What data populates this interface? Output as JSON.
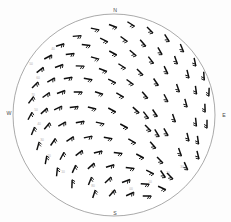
{
  "cardinals": [
    {
      "label": "N",
      "x": 115,
      "y": 11
    },
    {
      "label": "E",
      "x": 224,
      "y": 116
    },
    {
      "label": "S",
      "x": 115,
      "y": 214
    },
    {
      "label": "W",
      "x": 9,
      "y": 114
    }
  ],
  "limb": {
    "cx": 114,
    "cy": 115,
    "r": 101,
    "stroke": "#8e8e8e"
  },
  "pole": {
    "cx": 174,
    "cy": 147,
    "rays": 18,
    "ray_len": 9
  },
  "grid_labels": [
    {
      "text": "60",
      "x": 38,
      "y": 78
    },
    {
      "text": "70",
      "x": 33,
      "y": 95
    },
    {
      "text": "50",
      "x": 36,
      "y": 110
    },
    {
      "text": "40",
      "x": 39,
      "y": 124
    },
    {
      "text": "30",
      "x": 42,
      "y": 140
    },
    {
      "text": "20",
      "x": 49,
      "y": 156
    },
    {
      "text": "10",
      "x": 63,
      "y": 172
    },
    {
      "text": "80",
      "x": 93,
      "y": 186
    },
    {
      "text": "90",
      "x": 113,
      "y": 192
    },
    {
      "text": "00",
      "x": 131,
      "y": 189
    },
    {
      "text": "10",
      "x": 150,
      "y": 182
    },
    {
      "text": "20",
      "x": 168,
      "y": 173
    },
    {
      "text": "30",
      "x": 182,
      "y": 167
    },
    {
      "text": "50",
      "x": 31,
      "y": 64
    },
    {
      "text": "40",
      "x": 53,
      "y": 49
    }
  ],
  "chart_data": {
    "type": "scatter",
    "xlabel": "",
    "ylabel": "",
    "projection": "polar-stereographic",
    "legend": "none",
    "grid": true,
    "barbs": [
      {
        "x": 113,
        "y": 26,
        "a": 200,
        "n": 2
      },
      {
        "x": 131,
        "y": 24,
        "a": 212,
        "n": 2
      },
      {
        "x": 95,
        "y": 29,
        "a": 192,
        "n": 2
      },
      {
        "x": 150,
        "y": 30,
        "a": 225,
        "n": 2
      },
      {
        "x": 77,
        "y": 36,
        "a": 175,
        "n": 2
      },
      {
        "x": 167,
        "y": 38,
        "a": 237,
        "n": 2
      },
      {
        "x": 60,
        "y": 45,
        "a": 163,
        "n": 2
      },
      {
        "x": 182,
        "y": 48,
        "a": 247,
        "n": 2
      },
      {
        "x": 104,
        "y": 40,
        "a": 205,
        "n": 2
      },
      {
        "x": 124,
        "y": 39,
        "a": 216,
        "n": 2
      },
      {
        "x": 143,
        "y": 43,
        "a": 228,
        "n": 2
      },
      {
        "x": 86,
        "y": 45,
        "a": 188,
        "n": 2
      },
      {
        "x": 160,
        "y": 51,
        "a": 240,
        "n": 2
      },
      {
        "x": 48,
        "y": 57,
        "a": 152,
        "n": 2
      },
      {
        "x": 195,
        "y": 62,
        "a": 258,
        "n": 2
      },
      {
        "x": 70,
        "y": 54,
        "a": 172,
        "n": 2
      },
      {
        "x": 113,
        "y": 53,
        "a": 208,
        "n": 2
      },
      {
        "x": 133,
        "y": 53,
        "a": 220,
        "n": 2
      },
      {
        "x": 176,
        "y": 60,
        "a": 250,
        "n": 2
      },
      {
        "x": 95,
        "y": 58,
        "a": 196,
        "n": 2
      },
      {
        "x": 40,
        "y": 70,
        "a": 142,
        "n": 2
      },
      {
        "x": 59,
        "y": 66,
        "a": 160,
        "n": 2
      },
      {
        "x": 204,
        "y": 76,
        "a": 266,
        "n": 2
      },
      {
        "x": 151,
        "y": 60,
        "a": 232,
        "n": 2
      },
      {
        "x": 80,
        "y": 66,
        "a": 182,
        "n": 2
      },
      {
        "x": 122,
        "y": 66,
        "a": 212,
        "n": 2
      },
      {
        "x": 103,
        "y": 70,
        "a": 200,
        "n": 2
      },
      {
        "x": 166,
        "y": 70,
        "a": 244,
        "n": 2
      },
      {
        "x": 188,
        "y": 74,
        "a": 256,
        "n": 2
      },
      {
        "x": 35,
        "y": 85,
        "a": 134,
        "n": 2
      },
      {
        "x": 51,
        "y": 80,
        "a": 150,
        "n": 2
      },
      {
        "x": 68,
        "y": 78,
        "a": 170,
        "n": 2
      },
      {
        "x": 140,
        "y": 72,
        "a": 224,
        "n": 2
      },
      {
        "x": 88,
        "y": 79,
        "a": 190,
        "n": 2
      },
      {
        "x": 209,
        "y": 92,
        "a": 272,
        "n": 2
      },
      {
        "x": 112,
        "y": 81,
        "a": 206,
        "n": 2
      },
      {
        "x": 130,
        "y": 82,
        "a": 216,
        "n": 2
      },
      {
        "x": 156,
        "y": 82,
        "a": 236,
        "n": 2
      },
      {
        "x": 178,
        "y": 88,
        "a": 250,
        "n": 2
      },
      {
        "x": 196,
        "y": 90,
        "a": 262,
        "n": 2
      },
      {
        "x": 31,
        "y": 100,
        "a": 126,
        "n": 2
      },
      {
        "x": 46,
        "y": 95,
        "a": 144,
        "n": 2
      },
      {
        "x": 61,
        "y": 92,
        "a": 160,
        "n": 2
      },
      {
        "x": 78,
        "y": 92,
        "a": 180,
        "n": 2
      },
      {
        "x": 99,
        "y": 93,
        "a": 198,
        "n": 2
      },
      {
        "x": 120,
        "y": 95,
        "a": 210,
        "n": 2
      },
      {
        "x": 145,
        "y": 95,
        "a": 228,
        "n": 2
      },
      {
        "x": 166,
        "y": 98,
        "a": 242,
        "n": 2
      },
      {
        "x": 186,
        "y": 103,
        "a": 254,
        "n": 2
      },
      {
        "x": 205,
        "y": 108,
        "a": 268,
        "n": 2
      },
      {
        "x": 30,
        "y": 116,
        "a": 118,
        "n": 2
      },
      {
        "x": 44,
        "y": 111,
        "a": 138,
        "n": 2
      },
      {
        "x": 58,
        "y": 108,
        "a": 155,
        "n": 2
      },
      {
        "x": 74,
        "y": 107,
        "a": 174,
        "n": 2
      },
      {
        "x": 92,
        "y": 108,
        "a": 194,
        "n": 2
      },
      {
        "x": 112,
        "y": 110,
        "a": 208,
        "n": 2
      },
      {
        "x": 136,
        "y": 110,
        "a": 222,
        "n": 2
      },
      {
        "x": 155,
        "y": 113,
        "a": 236,
        "n": 2
      },
      {
        "x": 174,
        "y": 118,
        "a": 250,
        "n": 2
      },
      {
        "x": 196,
        "y": 122,
        "a": 264,
        "n": 2
      },
      {
        "x": 33,
        "y": 131,
        "a": 112,
        "n": 2
      },
      {
        "x": 47,
        "y": 126,
        "a": 130,
        "n": 2
      },
      {
        "x": 62,
        "y": 124,
        "a": 150,
        "n": 2
      },
      {
        "x": 80,
        "y": 122,
        "a": 170,
        "n": 2
      },
      {
        "x": 100,
        "y": 123,
        "a": 192,
        "n": 2
      },
      {
        "x": 124,
        "y": 126,
        "a": 208,
        "n": 2
      },
      {
        "x": 148,
        "y": 128,
        "a": 226,
        "n": 2
      },
      {
        "x": 166,
        "y": 132,
        "a": 240,
        "n": 2
      },
      {
        "x": 188,
        "y": 137,
        "a": 256,
        "n": 2
      },
      {
        "x": 38,
        "y": 146,
        "a": 106,
        "n": 2
      },
      {
        "x": 53,
        "y": 142,
        "a": 124,
        "n": 2
      },
      {
        "x": 70,
        "y": 139,
        "a": 146,
        "n": 2
      },
      {
        "x": 88,
        "y": 137,
        "a": 168,
        "n": 2
      },
      {
        "x": 108,
        "y": 138,
        "a": 190,
        "n": 2
      },
      {
        "x": 132,
        "y": 141,
        "a": 210,
        "n": 2
      },
      {
        "x": 153,
        "y": 145,
        "a": 228,
        "n": 2
      },
      {
        "x": 180,
        "y": 152,
        "a": 250,
        "n": 2
      },
      {
        "x": 198,
        "y": 140,
        "a": 262,
        "n": 2
      },
      {
        "x": 46,
        "y": 160,
        "a": 100,
        "n": 2
      },
      {
        "x": 62,
        "y": 156,
        "a": 118,
        "n": 2
      },
      {
        "x": 79,
        "y": 153,
        "a": 142,
        "n": 2
      },
      {
        "x": 98,
        "y": 152,
        "a": 166,
        "n": 2
      },
      {
        "x": 118,
        "y": 153,
        "a": 188,
        "n": 2
      },
      {
        "x": 140,
        "y": 156,
        "a": 208,
        "n": 2
      },
      {
        "x": 160,
        "y": 160,
        "a": 226,
        "n": 2
      },
      {
        "x": 186,
        "y": 166,
        "a": 246,
        "n": 2
      },
      {
        "x": 57,
        "y": 172,
        "a": 96,
        "n": 2
      },
      {
        "x": 74,
        "y": 169,
        "a": 114,
        "n": 2
      },
      {
        "x": 91,
        "y": 166,
        "a": 138,
        "n": 2
      },
      {
        "x": 110,
        "y": 166,
        "a": 162,
        "n": 2
      },
      {
        "x": 130,
        "y": 168,
        "a": 186,
        "n": 2
      },
      {
        "x": 150,
        "y": 172,
        "a": 206,
        "n": 2
      },
      {
        "x": 170,
        "y": 176,
        "a": 226,
        "n": 2
      },
      {
        "x": 72,
        "y": 184,
        "a": 92,
        "n": 2
      },
      {
        "x": 90,
        "y": 181,
        "a": 112,
        "n": 2
      },
      {
        "x": 108,
        "y": 180,
        "a": 136,
        "n": 2
      },
      {
        "x": 126,
        "y": 181,
        "a": 160,
        "n": 2
      },
      {
        "x": 145,
        "y": 184,
        "a": 184,
        "n": 2
      },
      {
        "x": 162,
        "y": 188,
        "a": 204,
        "n": 2
      },
      {
        "x": 94,
        "y": 194,
        "a": 108,
        "n": 2
      },
      {
        "x": 112,
        "y": 193,
        "a": 132,
        "n": 2
      },
      {
        "x": 130,
        "y": 194,
        "a": 156,
        "n": 2
      },
      {
        "x": 147,
        "y": 196,
        "a": 180,
        "n": 2
      },
      {
        "x": 163,
        "y": 174,
        "a": 236,
        "n": 2
      },
      {
        "x": 198,
        "y": 155,
        "a": 256,
        "n": 2
      },
      {
        "x": 207,
        "y": 124,
        "a": 270,
        "n": 2
      },
      {
        "x": 157,
        "y": 133,
        "a": 238,
        "n": 2
      },
      {
        "x": 146,
        "y": 115,
        "a": 232,
        "n": 2
      }
    ]
  }
}
